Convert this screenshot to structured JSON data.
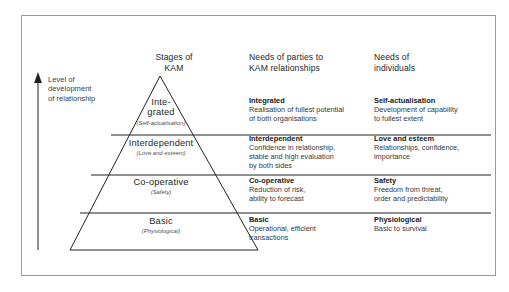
{
  "figure": {
    "columns": {
      "stages_heading": "Stages of\nKAM",
      "parties_heading": "Needs of parties to\nKAM relationships",
      "individuals_heading": "Needs of\nindividuals"
    },
    "axis": {
      "label": "Level of\ndevelopment\nof relationship",
      "direction": "upward-arrow"
    },
    "tiers": [
      {
        "stage_name": "Inte-\ngrated",
        "stage_sub": "(Self-actualisation)",
        "parties_title": "Integrated",
        "parties_body": "Realisation of fullest potential\nof both organisations",
        "individuals_title": "Self-actualisation",
        "individuals_body": "Development of capability\nto fullest extent"
      },
      {
        "stage_name": "Interdependent",
        "stage_sub": "(Love and esteem)",
        "parties_title": "Interdependent",
        "parties_body": "Confidence in relationship,\nstable and high evaluation\nby both sides",
        "individuals_title": "Love and esteem",
        "individuals_body": "Relationships, confidence,\nimportance"
      },
      {
        "stage_name": "Co-operative",
        "stage_sub": "(Safety)",
        "parties_title": "Co-operative",
        "parties_body": "Reduction of risk,\nability to forecast",
        "individuals_title": "Safety",
        "individuals_body": "Freedom from threat,\norder and predictability"
      },
      {
        "stage_name": "Basic",
        "stage_sub": "(Physiological)",
        "parties_title": "Basic",
        "parties_body": "Operational, efficient\ntransactions",
        "individuals_title": "Physiological",
        "individuals_body": "Basic to survival"
      }
    ],
    "colors": {
      "line": "#1f2225",
      "border": "#9a9a9a",
      "text": "#23272b",
      "background": "#ffffff"
    }
  }
}
